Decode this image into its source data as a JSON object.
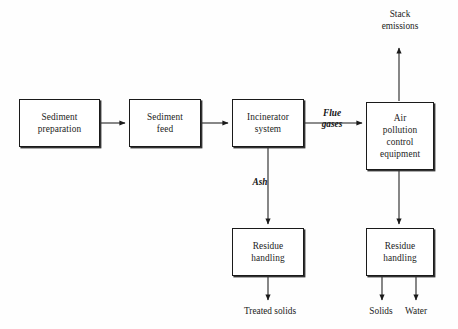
{
  "diagram": {
    "stroke_color": "#1a1a1a",
    "background_color": "#fefefe",
    "boxes": [
      {
        "id": "sediment-preparation",
        "label": "Sediment\npreparation",
        "x": 19,
        "y": 99,
        "w": 81,
        "h": 48
      },
      {
        "id": "sediment-feed",
        "label": "Sediment\nfeed",
        "x": 129,
        "y": 99,
        "w": 72,
        "h": 48
      },
      {
        "id": "incinerator-system",
        "label": "Incinerator\nsystem",
        "x": 232,
        "y": 99,
        "w": 72,
        "h": 48
      },
      {
        "id": "air-pollution-control-equipment",
        "label": "Air\npollution\ncontrol\nequipment",
        "x": 366,
        "y": 102,
        "w": 68,
        "h": 68
      },
      {
        "id": "residue-handling-ash",
        "label": "Residue\nhandling",
        "x": 232,
        "y": 228,
        "w": 72,
        "h": 48
      },
      {
        "id": "residue-handling-apc",
        "label": "Residue\nhandling",
        "x": 366,
        "y": 228,
        "w": 68,
        "h": 48
      }
    ],
    "stream_labels": [
      {
        "id": "flue-gases",
        "label": "Flue\ngases",
        "x": 310,
        "y": 108,
        "w": 44
      },
      {
        "id": "ash",
        "label": "Ash",
        "x": 243,
        "y": 177,
        "w": 34
      }
    ],
    "io_labels": [
      {
        "id": "stack-emissions",
        "label": "Stack\nemissions",
        "x": 366,
        "y": 9,
        "w": 68
      },
      {
        "id": "treated-solids",
        "label": "Treated solids",
        "x": 225,
        "y": 306,
        "w": 90
      },
      {
        "id": "solids",
        "label": "Solids",
        "x": 358,
        "y": 306,
        "w": 46
      },
      {
        "id": "water",
        "label": "Water",
        "x": 393,
        "y": 306,
        "w": 46
      }
    ]
  }
}
